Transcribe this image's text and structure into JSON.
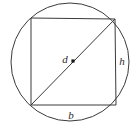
{
  "figure": {
    "background_color": "#ffffff",
    "stroke_color": "#3a3a3a",
    "label_color": "#2b2b2b",
    "canvas": {
      "width": 137,
      "height": 134
    },
    "circle": {
      "name": "circumscribed-circle",
      "center_x": 70,
      "center_y": 62,
      "radius": 59,
      "stroke_width": 1
    },
    "square": {
      "name": "inscribed-square",
      "points": "31,18 115,19 116,105 31,105",
      "top_left_x": 31,
      "top_left_y": 18,
      "top_right_x": 115,
      "top_right_y": 19,
      "bottom_right_x": 116,
      "bottom_right_y": 105,
      "bottom_left_x": 31,
      "bottom_left_y": 105,
      "stroke_width": 1
    },
    "diagonal": {
      "name": "diagonal-d",
      "x1": 31,
      "y1": 105,
      "x2": 115,
      "y2": 19,
      "stroke_width": 1
    },
    "center_dot": {
      "name": "center-point",
      "cx": 73,
      "cy": 61,
      "size": 3.2
    },
    "labels": {
      "diagonal": {
        "text": "d",
        "x": 65,
        "y": 60
      },
      "height": {
        "text": "h",
        "x": 122,
        "y": 62
      },
      "base": {
        "text": "b",
        "x": 71,
        "y": 116
      }
    }
  }
}
